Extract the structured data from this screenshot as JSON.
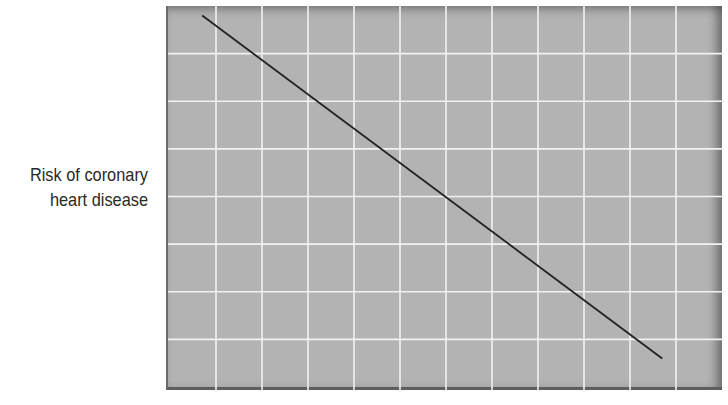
{
  "chart_data": {
    "type": "line",
    "title": "",
    "xlabel": "",
    "ylabel": "Risk of coronary heart disease",
    "ylabel_lines": [
      "Risk of coronary",
      "heart disease"
    ],
    "x_ticks": [],
    "y_ticks": [],
    "grid": true,
    "grid_columns": 12,
    "grid_rows": 8,
    "xlim": [
      0,
      12
    ],
    "ylim": [
      0,
      8
    ],
    "legend": null,
    "series": [
      {
        "name": "Risk trend",
        "x": [
          0.7,
          10.7
        ],
        "y": [
          7.8,
          0.6
        ],
        "color": "#222222"
      }
    ],
    "colors": {
      "plot_background": "#b3b3b3",
      "grid": "#f2f2f2",
      "line": "#222222",
      "label": "#2a2a2a"
    }
  }
}
